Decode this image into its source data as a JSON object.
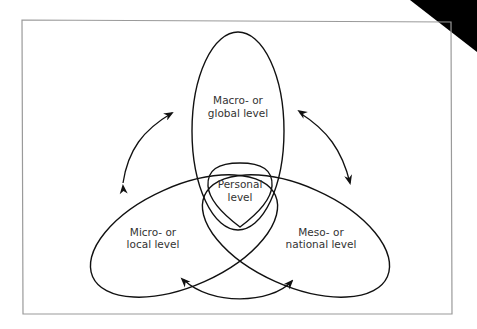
{
  "diagram": {
    "type": "overlapping-ellipses",
    "levels": {
      "macro": {
        "line1": "Macro- or",
        "line2": "global level"
      },
      "micro": {
        "line1": "Micro- or",
        "line2": "local level"
      },
      "meso": {
        "line1": "Meso- or",
        "line2": "national level"
      },
      "personal": {
        "line1": "Personal",
        "line2": "level"
      }
    },
    "arrows": [
      {
        "between": [
          "micro",
          "macro"
        ],
        "direction": "bidirectional"
      },
      {
        "between": [
          "macro",
          "meso"
        ],
        "direction": "bidirectional"
      },
      {
        "between": [
          "micro",
          "meso"
        ],
        "direction": "bidirectional"
      }
    ],
    "colors": {
      "line": "#111111",
      "text": "#333333",
      "frame": "#9a9a9a",
      "corner": "#000000"
    }
  }
}
